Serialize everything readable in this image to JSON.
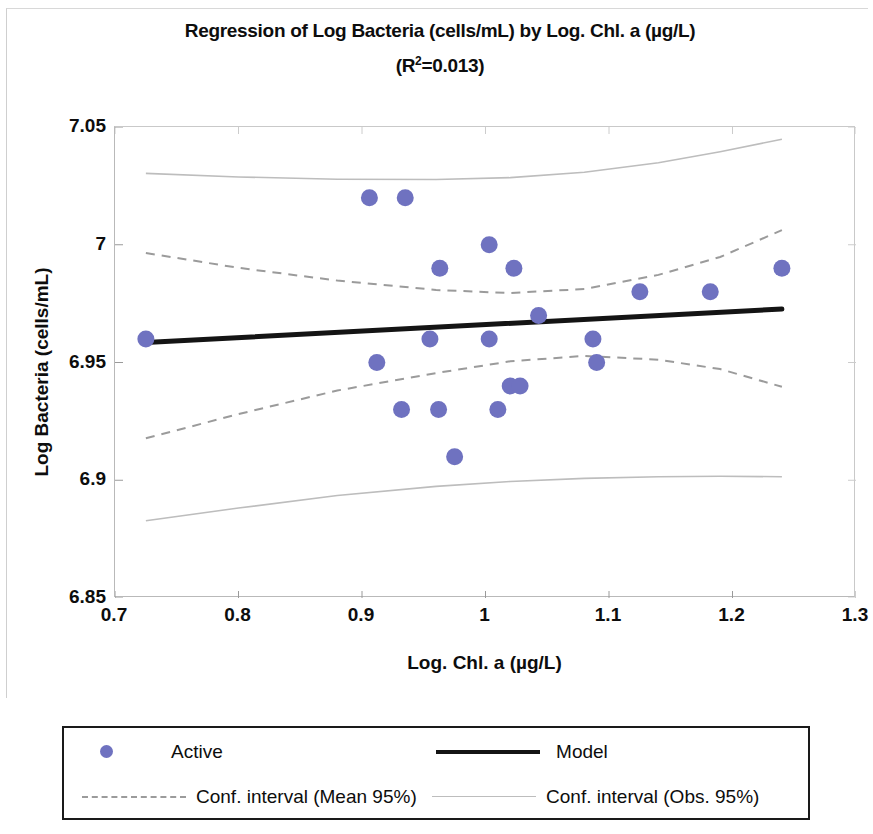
{
  "chart_data": {
    "type": "scatter",
    "title": "Regression of Log Bacteria (cells/mL) by Log. Chl. a (µg/L)",
    "subtitle": "(R²=0.013)",
    "r_squared": 0.013,
    "xlabel": "Log. Chl. a (µg/L)",
    "ylabel": "Log Bacteria (cells/mL)",
    "xlim": [
      0.7,
      1.3
    ],
    "ylim": [
      6.85,
      7.05
    ],
    "xticks": [
      "0.7",
      "0.8",
      "0.9",
      "1",
      "1.1",
      "1.2",
      "1.3"
    ],
    "xtick_values": [
      0.7,
      0.8,
      0.9,
      1.0,
      1.1,
      1.2,
      1.3
    ],
    "yticks": [
      "6.85",
      "6.9",
      "6.95",
      "7",
      "7.05"
    ],
    "ytick_values": [
      6.85,
      6.9,
      6.95,
      7.0,
      7.05
    ],
    "grid": false,
    "legend_position": "below",
    "marker_color": "#6f72c0",
    "model_color": "#141414",
    "conf_mean_color": "#9b9b9b",
    "conf_obs_color": "#bdbdbd",
    "series": [
      {
        "name": "Active",
        "type": "scatter",
        "points": [
          {
            "x": 0.725,
            "y": 6.96
          },
          {
            "x": 0.906,
            "y": 7.02
          },
          {
            "x": 0.935,
            "y": 7.02
          },
          {
            "x": 0.912,
            "y": 6.95
          },
          {
            "x": 0.932,
            "y": 6.93
          },
          {
            "x": 0.955,
            "y": 6.96
          },
          {
            "x": 0.963,
            "y": 6.99
          },
          {
            "x": 0.962,
            "y": 6.93
          },
          {
            "x": 0.975,
            "y": 6.91
          },
          {
            "x": 1.003,
            "y": 7.0
          },
          {
            "x": 1.003,
            "y": 6.96
          },
          {
            "x": 1.01,
            "y": 6.93
          },
          {
            "x": 1.02,
            "y": 6.94
          },
          {
            "x": 1.028,
            "y": 6.94
          },
          {
            "x": 1.023,
            "y": 6.99
          },
          {
            "x": 1.043,
            "y": 6.97
          },
          {
            "x": 1.087,
            "y": 6.96
          },
          {
            "x": 1.09,
            "y": 6.95
          },
          {
            "x": 1.125,
            "y": 6.98
          },
          {
            "x": 1.182,
            "y": 6.98
          },
          {
            "x": 1.24,
            "y": 6.99
          }
        ]
      },
      {
        "name": "Model",
        "type": "line",
        "points": [
          {
            "x": 0.725,
            "y": 6.9585
          },
          {
            "x": 1.24,
            "y": 6.9727
          }
        ]
      },
      {
        "name": "Conf. interval (Mean 95%) upper",
        "type": "line",
        "points": [
          {
            "x": 0.725,
            "y": 6.9965
          },
          {
            "x": 0.8,
            "y": 6.9902
          },
          {
            "x": 0.88,
            "y": 6.9848
          },
          {
            "x": 0.96,
            "y": 6.9808
          },
          {
            "x": 1.02,
            "y": 6.9795
          },
          {
            "x": 1.08,
            "y": 6.9812
          },
          {
            "x": 1.14,
            "y": 6.9872
          },
          {
            "x": 1.19,
            "y": 6.9948
          },
          {
            "x": 1.24,
            "y": 7.0062
          }
        ]
      },
      {
        "name": "Conf. interval (Mean 95%) lower",
        "type": "line",
        "points": [
          {
            "x": 0.725,
            "y": 6.9178
          },
          {
            "x": 0.8,
            "y": 6.9281
          },
          {
            "x": 0.88,
            "y": 6.9381
          },
          {
            "x": 0.96,
            "y": 6.9455
          },
          {
            "x": 1.02,
            "y": 6.9505
          },
          {
            "x": 1.08,
            "y": 6.9528
          },
          {
            "x": 1.14,
            "y": 6.9512
          },
          {
            "x": 1.19,
            "y": 6.9472
          },
          {
            "x": 1.24,
            "y": 6.9397
          }
        ]
      },
      {
        "name": "Conf. interval (Obs. 95%) upper",
        "type": "line",
        "points": [
          {
            "x": 0.725,
            "y": 7.0303
          },
          {
            "x": 0.8,
            "y": 7.0288
          },
          {
            "x": 0.88,
            "y": 7.0278
          },
          {
            "x": 0.96,
            "y": 7.0277
          },
          {
            "x": 1.02,
            "y": 7.0285
          },
          {
            "x": 1.08,
            "y": 7.0308
          },
          {
            "x": 1.14,
            "y": 7.0348
          },
          {
            "x": 1.19,
            "y": 7.0395
          },
          {
            "x": 1.24,
            "y": 7.0448
          }
        ]
      },
      {
        "name": "Conf. interval (Obs. 95%) lower",
        "type": "line",
        "points": [
          {
            "x": 0.725,
            "y": 6.8828
          },
          {
            "x": 0.8,
            "y": 6.8882
          },
          {
            "x": 0.88,
            "y": 6.8935
          },
          {
            "x": 0.96,
            "y": 6.8974
          },
          {
            "x": 1.02,
            "y": 6.8995
          },
          {
            "x": 1.08,
            "y": 6.9008
          },
          {
            "x": 1.14,
            "y": 6.9015
          },
          {
            "x": 1.19,
            "y": 6.9017
          },
          {
            "x": 1.24,
            "y": 6.9015
          }
        ]
      }
    ],
    "legend": [
      {
        "label": "Active",
        "key": "dot"
      },
      {
        "label": "Model",
        "key": "solid"
      },
      {
        "label": "Conf. interval (Mean 95%)",
        "key": "dashed"
      },
      {
        "label": "Conf. interval (Obs. 95%)",
        "key": "thin"
      }
    ]
  }
}
